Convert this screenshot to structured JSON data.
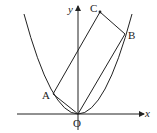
{
  "diagram": {
    "type": "parabola-rectangle",
    "axes": {
      "x_label": "x",
      "y_label": "y"
    },
    "points": {
      "O": "O",
      "A": "A",
      "B": "B",
      "C": "C"
    },
    "shape": "rectangle OACB inscribed with parabola through O, A, B",
    "colors": {
      "stroke": "#222222",
      "background": "#ffffff"
    }
  }
}
